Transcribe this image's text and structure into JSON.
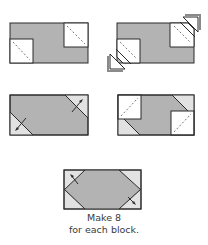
{
  "colors": {
    "main_fabric": "#b3b3b3",
    "corner_fabric_light": "#e2e2e2",
    "background_square": "#ffffff",
    "outline": "#2a2a2a",
    "text": "#3a3a3a"
  },
  "steps": [
    {
      "id": 1,
      "description": "Rectangle with white squares placed on top-right and bottom-left corners, dashed diagonal sewing lines"
    },
    {
      "id": 2,
      "description": "Stitch on diagonal and trim; corner triangles removed"
    },
    {
      "id": 3,
      "description": "Press corners open; light corner triangles on top-right and bottom-left"
    },
    {
      "id": 4,
      "description": "Add white squares to remaining top-left and bottom-right corners with dashed diagonals"
    },
    {
      "id": 5,
      "description": "Finished unit with all four light corner triangles pressed out"
    }
  ],
  "caption": {
    "line1": "Make 8",
    "line2": "for each block."
  }
}
